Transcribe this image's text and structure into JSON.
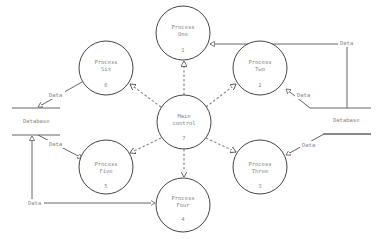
{
  "diagram": {
    "type": "data-flow-diagram",
    "processes": [
      {
        "id": "one",
        "name_line1": "Process",
        "name_line2": "One",
        "number": "1"
      },
      {
        "id": "two",
        "name_line1": "Process",
        "name_line2": "Two",
        "number": "2"
      },
      {
        "id": "three",
        "name_line1": "Process",
        "name_line2": "Three",
        "number": "3"
      },
      {
        "id": "four",
        "name_line1": "Process",
        "name_line2": "Four",
        "number": "4"
      },
      {
        "id": "five",
        "name_line1": "Process",
        "name_line2": "Five",
        "number": "5"
      },
      {
        "id": "six",
        "name_line1": "Process",
        "name_line2": "Six",
        "number": "6"
      }
    ],
    "main": {
      "name_line1": "Main",
      "name_line2": "control",
      "number": "7"
    },
    "stores": [
      {
        "id": "left",
        "label": "Database"
      },
      {
        "id": "right",
        "label": "Database"
      }
    ],
    "flow_label": "Data",
    "control_label": "?"
  }
}
